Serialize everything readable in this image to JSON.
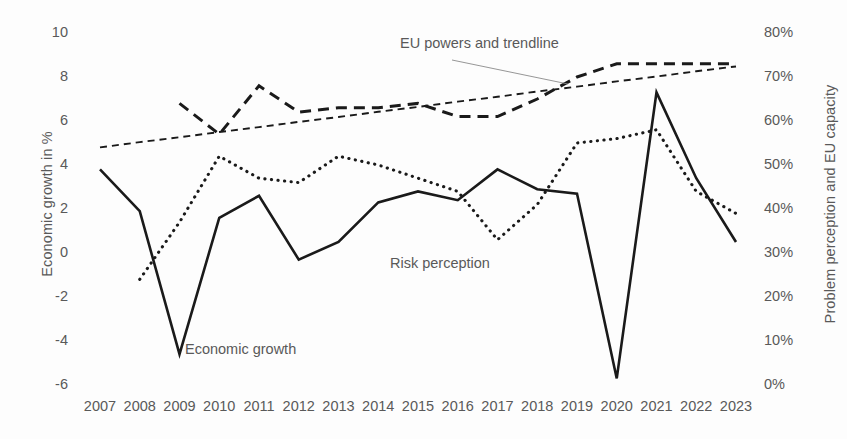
{
  "chart_data": {
    "type": "line",
    "title": "",
    "xlabel": "",
    "categories": [
      "2007",
      "2008",
      "2009",
      "2010",
      "2011",
      "2012",
      "2013",
      "2014",
      "2015",
      "2016",
      "2017",
      "2018",
      "2019",
      "2020",
      "2021",
      "2022",
      "2023"
    ],
    "left_axis": {
      "label": "Economic growth in %",
      "ticks": [
        "10",
        "8",
        "6",
        "4",
        "2",
        "0",
        "-2",
        "-4",
        "-6"
      ],
      "tick_values": [
        10,
        8,
        6,
        4,
        2,
        0,
        -2,
        -4,
        -6
      ],
      "ylim": [
        -6,
        10
      ]
    },
    "right_axis": {
      "label": "Problem perception and EU capacity",
      "ticks": [
        "80%",
        "70%",
        "60%",
        "50%",
        "40%",
        "30%",
        "20%",
        "10%",
        "0%"
      ],
      "tick_values": [
        80,
        70,
        60,
        50,
        40,
        30,
        20,
        10,
        0
      ],
      "ylim": [
        0,
        80
      ]
    },
    "grid": false,
    "legend_position": "inline-annotations",
    "series": [
      {
        "name": "Economic growth",
        "label": "Economic growth",
        "axis": "left",
        "unit": "%",
        "style": "solid",
        "color": "#1a1a1a",
        "values": [
          3.8,
          1.9,
          -4.6,
          1.6,
          2.6,
          -0.3,
          0.5,
          2.3,
          2.8,
          2.4,
          3.8,
          2.9,
          2.7,
          -5.7,
          7.3,
          3.4,
          0.5
        ]
      },
      {
        "name": "Risk perception",
        "label": "Risk perception",
        "axis": "right",
        "unit": "%",
        "style": "dotted",
        "color": "#1a1a1a",
        "values": [
          null,
          24,
          37,
          52,
          47,
          46,
          52,
          50,
          47,
          44,
          33,
          41,
          55,
          56,
          58,
          44,
          39
        ]
      },
      {
        "name": "EU powers",
        "label": "EU powers and trendline",
        "axis": "right",
        "unit": "%",
        "style": "dashed-bold",
        "color": "#1a1a1a",
        "values": [
          null,
          null,
          64,
          57,
          68,
          62,
          63,
          63,
          64,
          61,
          61,
          65,
          70,
          73,
          73,
          73,
          73
        ]
      },
      {
        "name": "Trendline",
        "label": "trendline",
        "axis": "right",
        "unit": "%",
        "style": "dashed-thin",
        "color": "#1a1a1a",
        "values": [
          54,
          55.2,
          56.3,
          57.5,
          58.6,
          59.8,
          60.9,
          62.1,
          63.2,
          64.4,
          65.5,
          66.7,
          67.8,
          69.0,
          70.1,
          71.3,
          72.4
        ],
        "trend_start": 54,
        "trend_end": 72.4
      }
    ],
    "annotations": [
      {
        "text": "EU powers and trendline",
        "target_series": "EU powers",
        "leader_line": true
      },
      {
        "text": "Risk perception",
        "target_series": "Risk perception",
        "leader_line": false
      },
      {
        "text": "Economic growth",
        "target_series": "Economic growth",
        "leader_line": false
      }
    ]
  },
  "colors": {
    "ink": "#1a1a1a",
    "text": "#595959",
    "background": "#fdfdfd"
  }
}
